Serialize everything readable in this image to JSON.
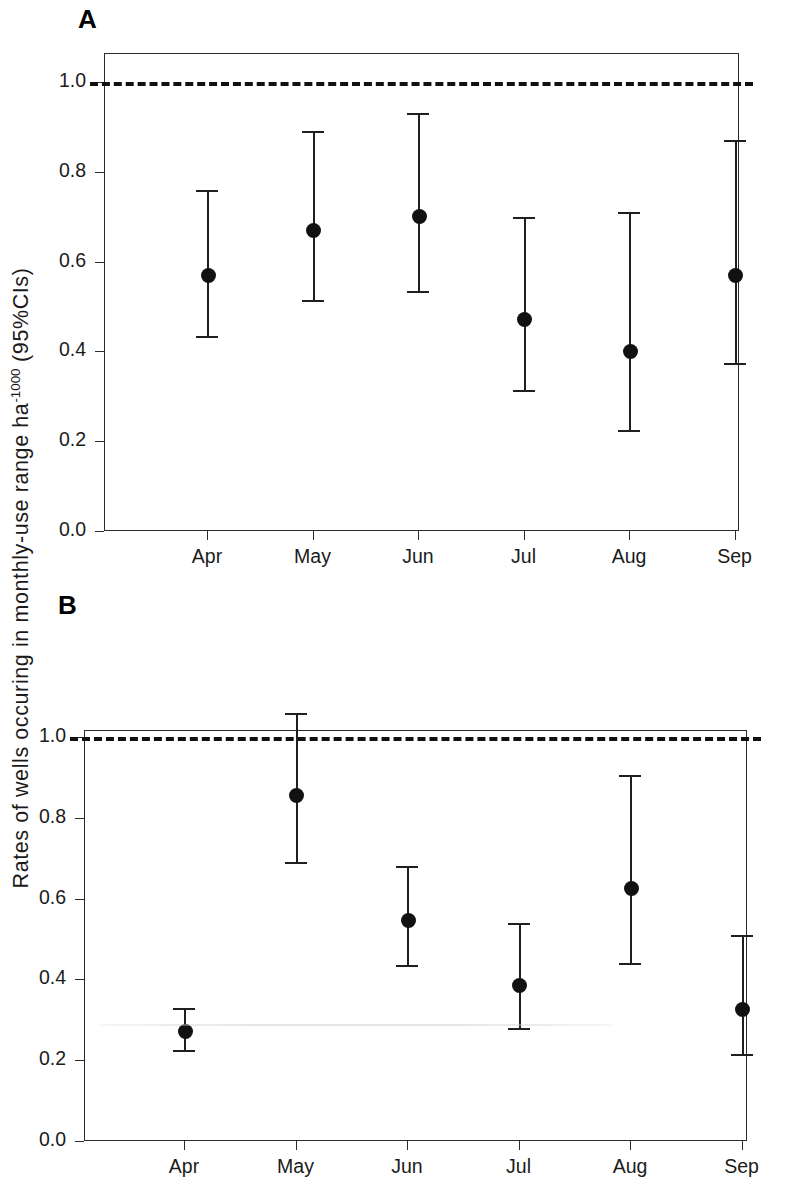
{
  "figure": {
    "y_axis_title_main": "Rates of wells occuring in monthly-use range ha",
    "y_axis_title_exponent": "-1000",
    "y_axis_title_tail": " (95%CIs)",
    "background_color": "#ffffff",
    "ink_color": "#1f1f1f"
  },
  "panels": [
    {
      "letter": "A",
      "id": "panel-a"
    },
    {
      "letter": "B",
      "id": "panel-b"
    }
  ],
  "chart_data": [
    {
      "type": "scatter",
      "panel": "A",
      "title": "",
      "xlabel": "",
      "ylabel": "Rates of wells occuring in monthly-use range ha-1000 (95%CIs)",
      "categories": [
        "Apr",
        "May",
        "Jun",
        "Jul",
        "Aug",
        "Sep"
      ],
      "values": [
        0.57,
        0.67,
        0.7,
        0.47,
        0.4,
        0.57
      ],
      "ci_lower": [
        0.43,
        0.51,
        0.53,
        0.31,
        0.22,
        0.37
      ],
      "ci_upper": [
        0.76,
        0.89,
        0.93,
        0.7,
        0.71,
        0.87
      ],
      "ylim": [
        0.0,
        1.08
      ],
      "yticks": [
        "0.0",
        "0.2",
        "0.4",
        "0.6",
        "0.8",
        "1.0"
      ],
      "ytick_values": [
        0.0,
        0.2,
        0.4,
        0.6,
        0.8,
        1.0
      ],
      "reference_line": 1.0,
      "reference_line_style": "dashed",
      "grid": false,
      "legend": "none",
      "marker": "filled-circle",
      "errorbar_style": "capped"
    },
    {
      "type": "scatter",
      "panel": "B",
      "title": "",
      "xlabel": "",
      "ylabel": "Rates of wells occuring in monthly-use range ha-1000 (95%CIs)",
      "categories": [
        "Apr",
        "May",
        "Jun",
        "Jul",
        "Aug",
        "Sep"
      ],
      "values": [
        0.27,
        0.855,
        0.545,
        0.385,
        0.625,
        0.325
      ],
      "ci_lower": [
        0.22,
        0.685,
        0.43,
        0.275,
        0.435,
        0.21
      ],
      "ci_upper": [
        0.33,
        1.06,
        0.68,
        0.54,
        0.905,
        0.51
      ],
      "ylim": [
        0.0,
        1.145
      ],
      "yticks": [
        "0.0",
        "0.2",
        "0.4",
        "0.6",
        "0.8",
        "1.0"
      ],
      "ytick_values": [
        0.0,
        0.2,
        0.4,
        0.6,
        0.8,
        1.0
      ],
      "reference_line": 1.0,
      "reference_line_style": "dashed",
      "grid": false,
      "legend": "none",
      "marker": "filled-circle",
      "errorbar_style": "capped"
    }
  ]
}
